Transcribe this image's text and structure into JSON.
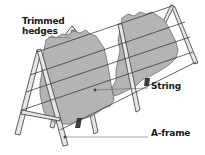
{
  "diagram": {
    "labels": {
      "hedges": "Trimmed hedges",
      "string": "String",
      "aframe": "A-frame"
    },
    "colors": {
      "foliage": "#b4b4b4",
      "foliage_edge": "#6f6f6f",
      "wood": "#e6e6e6",
      "wood_edge": "#3a3a3a",
      "string": "#2a2a2a",
      "trunk": "#3c3c3c",
      "leader": "#666666"
    }
  }
}
